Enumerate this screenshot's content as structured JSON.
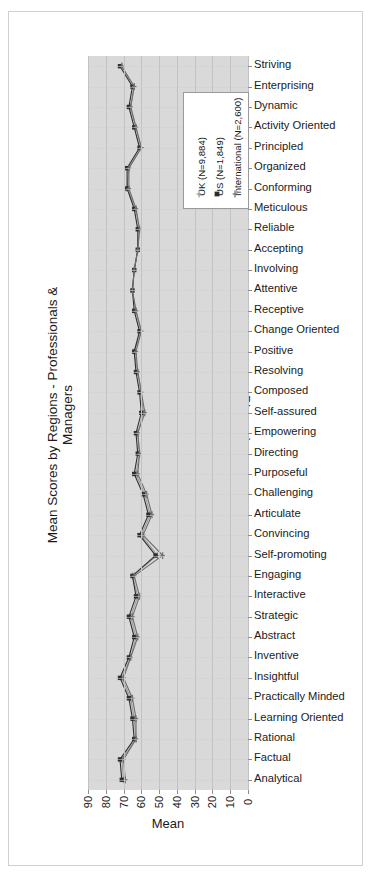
{
  "chart_data": {
    "type": "line",
    "orientation": "horizontal",
    "title": "Mean Scores by Regions - Professionals & Managers",
    "xlabel": "Mean",
    "ylabel": "Dimensions",
    "xlim": [
      90,
      0
    ],
    "x_reversed": true,
    "xticks": [
      "90",
      "80",
      "70",
      "60",
      "50",
      "40",
      "30",
      "20",
      "10",
      "0"
    ],
    "grid": true,
    "legend_position": "top-right-inside",
    "categories": [
      "Striving",
      "Enterprising",
      "Dynamic",
      "Activity Oriented",
      "Principled",
      "Organized",
      "Conforming",
      "Meticulous",
      "Reliable",
      "Accepting",
      "Involving",
      "Attentive",
      "Receptive",
      "Change Oriented",
      "Positive",
      "Resolving",
      "Composed",
      "Self-assured",
      "Empowering",
      "Directing",
      "Purposeful",
      "Challenging",
      "Articulate",
      "Convincing",
      "Self-promoting",
      "Engaging",
      "Interactive",
      "Strategic",
      "Abstract",
      "Inventive",
      "Insightful",
      "Practically Minded",
      "Learning Oriented",
      "Rational",
      "Factual",
      "Analytical"
    ],
    "series": [
      {
        "name": "UK (N=9,884)",
        "label": "UK",
        "n": "9,884",
        "color": "#9a9a9a",
        "marker": "plus",
        "values": [
          71,
          64,
          66,
          63,
          60,
          67,
          68,
          63,
          61,
          62,
          64,
          65,
          63,
          60,
          64,
          62,
          60,
          59,
          62,
          61,
          63,
          58,
          55,
          60,
          51,
          65,
          62,
          66,
          63,
          66,
          71,
          66,
          64,
          63,
          71,
          70
        ]
      },
      {
        "name": "US (N=1,849)",
        "label": "US",
        "n": "1,849",
        "color": "#2e2e2e",
        "marker": "square",
        "values": [
          72,
          65,
          67,
          64,
          61,
          68,
          68,
          64,
          62,
          62,
          64,
          65,
          64,
          61,
          64,
          63,
          61,
          60,
          63,
          62,
          64,
          59,
          56,
          61,
          52,
          65,
          63,
          67,
          64,
          67,
          72,
          67,
          65,
          64,
          72,
          71
        ]
      },
      {
        "name": "International (N=2,600)",
        "label": "International",
        "n": "2,600",
        "color": "#6e6e6e",
        "marker": "plus",
        "values": [
          71,
          64,
          66,
          63,
          60,
          67,
          67,
          63,
          61,
          62,
          64,
          65,
          63,
          60,
          63,
          62,
          60,
          58,
          62,
          61,
          62,
          57,
          54,
          59,
          48,
          64,
          61,
          65,
          62,
          66,
          70,
          65,
          63,
          63,
          70,
          69
        ]
      }
    ]
  },
  "legend": {
    "items": [
      {
        "label": "UK (N=9,884)"
      },
      {
        "label": "US (N=1,849)"
      },
      {
        "label": "International (N=2,600)"
      }
    ]
  }
}
